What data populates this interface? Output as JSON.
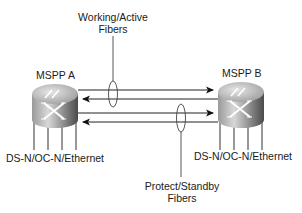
{
  "diagram": {
    "nodes": [
      {
        "id": "mspp-a",
        "label": "MSPP A",
        "interfaces_label": "DS-N/OC-N/Ethernet"
      },
      {
        "id": "mspp-b",
        "label": "MSPP B",
        "interfaces_label": "DS-N/OC-N/Ethernet"
      }
    ],
    "fiber_groups": [
      {
        "label_line1": "Working/Active",
        "label_line2": "Fibers"
      },
      {
        "label_line1": "Protect/Standby",
        "label_line2": "Fibers"
      }
    ],
    "links": [
      {
        "from": "MSPP A",
        "to": "MSPP B",
        "group": "Working/Active"
      },
      {
        "from": "MSPP B",
        "to": "MSPP A",
        "group": "Working/Active"
      },
      {
        "from": "MSPP A",
        "to": "MSPP B",
        "group": "Protect/Standby"
      },
      {
        "from": "MSPP B",
        "to": "MSPP A",
        "group": "Protect/Standby"
      }
    ]
  }
}
